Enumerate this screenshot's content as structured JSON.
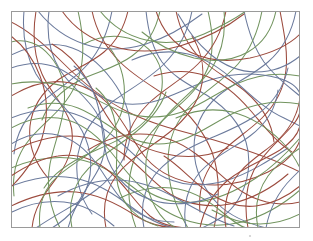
{
  "figure": {
    "width": 313,
    "height": 241,
    "background_color": "#ffffff"
  },
  "frame": {
    "x": 11,
    "y": 11,
    "width": 289,
    "height": 217,
    "stroke_color": "#9a9a9a",
    "stroke_width": 1
  },
  "palette": {
    "red": "#9c4b3e",
    "blue": "#6b7a9c",
    "green": "#72945f",
    "frame": "#9a9a9a",
    "speck": "#cfcfcf"
  },
  "marks": [
    {
      "name": "speck",
      "x": 250,
      "y": 236,
      "r": 1.1,
      "color": "#cfcfcf"
    }
  ],
  "chart_data": {
    "type": "line",
    "xlabel": "",
    "ylabel": "",
    "grid": false,
    "legend": "none",
    "xlim": [
      11,
      300
    ],
    "ylim": [
      11,
      228
    ],
    "stroke_width": 1.05,
    "series": [
      {
        "name": "curve-01",
        "color": "#9c4b3e",
        "d": "M 36 11 C 32 36, 34 56, 42 74 C 50 92, 64 104, 70 122 C 76 140, 70 160, 58 176 C 46 192, 34 206, 32 228"
      },
      {
        "name": "curve-02",
        "color": "#6b7a9c",
        "d": "M 49 11 C 46 34, 50 54, 60 70 C 70 86, 86 96, 96 112 C 106 128, 108 148, 100 166 C 92 184, 76 198, 68 228"
      },
      {
        "name": "curve-03",
        "color": "#9c4b3e",
        "d": "M 11 22 C 28 30, 46 46, 62 62 C 82 82, 104 100, 128 112 C 156 126, 186 132, 214 140 C 244 149, 272 158, 300 172"
      },
      {
        "name": "curve-04",
        "color": "#6b7a9c",
        "d": "M 11 55 C 30 46, 48 42, 66 46 C 86 51, 100 64, 112 80 C 124 96, 132 116, 130 136 C 128 158, 114 176, 96 190 C 78 204, 56 214, 36 228"
      },
      {
        "name": "curve-05",
        "color": "#72945f",
        "d": "M 11 42 C 26 38, 40 44, 50 56 C 62 70, 66 88, 64 106 C 62 126, 54 144, 50 164 C 46 186, 50 208, 60 228"
      },
      {
        "name": "curve-06",
        "color": "#72945f",
        "d": "M 78 11 C 82 28, 84 46, 82 62 C 80 80, 72 94, 62 106 C 50 120, 36 130, 26 144 C 16 158, 12 176, 14 196"
      },
      {
        "name": "curve-07",
        "color": "#9c4b3e",
        "d": "M 92 11 C 96 30, 106 48, 120 62 C 136 78, 156 88, 172 100 C 190 114, 204 132, 212 152 C 220 174, 220 200, 214 228"
      },
      {
        "name": "curve-08",
        "color": "#6b7a9c",
        "d": "M 112 11 C 108 32, 100 50, 88 64 C 74 80, 56 90, 42 102 C 26 116, 16 134, 14 154"
      },
      {
        "name": "curve-09",
        "color": "#72945f",
        "d": "M 84 44 C 100 36, 118 34, 134 40 C 150 46, 160 60, 162 76 C 164 94, 156 110, 144 122 C 130 136, 110 144, 92 152 C 72 161, 54 172, 44 188"
      },
      {
        "name": "curve-10",
        "color": "#9c4b3e",
        "d": "M 128 11 C 124 28, 116 42, 104 52 C 90 64, 72 70, 58 80 C 42 92, 32 108, 30 126 C 28 146, 36 164, 48 178"
      },
      {
        "name": "curve-11",
        "color": "#6b7a9c",
        "d": "M 146 11 C 148 30, 152 48, 162 62 C 174 78, 192 86, 208 96 C 226 108, 240 124, 246 142 C 252 162, 248 184, 238 200 C 228 216, 214 222, 202 228"
      },
      {
        "name": "curve-12",
        "color": "#72945f",
        "d": "M 160 11 C 156 30, 146 46, 132 56 C 116 68, 96 72, 80 80 C 62 90, 48 104, 42 120"
      },
      {
        "name": "curve-13",
        "color": "#9c4b3e",
        "d": "M 176 11 C 180 30, 188 46, 200 58 C 214 72, 232 80, 246 92 C 262 106, 272 124, 274 142"
      },
      {
        "name": "curve-14",
        "color": "#6b7a9c",
        "d": "M 192 11 C 188 32, 178 50, 164 64 C 148 80, 128 90, 112 102 C 94 116, 82 134, 78 154 C 74 176, 80 198, 92 214"
      },
      {
        "name": "curve-15",
        "color": "#72945f",
        "d": "M 208 11 C 212 28, 214 46, 210 62 C 204 82, 190 96, 176 108 C 158 124, 142 140, 134 160 C 126 182, 128 206, 136 228"
      },
      {
        "name": "curve-16",
        "color": "#9c4b3e",
        "d": "M 226 11 C 222 32, 212 50, 198 64 C 182 80, 162 90, 148 104 C 132 120, 124 140, 124 160"
      },
      {
        "name": "curve-17",
        "color": "#6b7a9c",
        "d": "M 244 11 C 248 30, 254 48, 264 62 C 276 78, 290 88, 300 96"
      },
      {
        "name": "curve-18",
        "color": "#72945f",
        "d": "M 262 11 C 258 32, 250 50, 238 64 C 224 80, 206 90, 192 104 C 176 120, 168 140, 168 162 C 168 186, 176 208, 188 228"
      },
      {
        "name": "curve-19",
        "color": "#9c4b3e",
        "d": "M 280 11 C 284 32, 288 52, 286 70 C 284 90, 274 106, 262 118 C 248 132, 230 142, 218 156 C 204 172, 198 192, 200 212"
      },
      {
        "name": "curve-20",
        "color": "#6b7a9c",
        "d": "M 296 11 C 292 32, 282 50, 268 62 C 252 76, 232 84, 218 96 C 202 110, 194 128, 194 148 C 194 170, 204 190, 218 204 C 232 218, 250 224, 266 228"
      },
      {
        "name": "curve-21",
        "color": "#9c4b3e",
        "d": "M 11 96 C 28 86, 46 80, 64 82 C 84 84, 100 94, 112 108 C 126 124, 134 144, 146 158 C 160 174, 180 182, 200 184 C 224 187, 248 182, 268 172 C 286 163, 296 152, 300 140"
      },
      {
        "name": "curve-22",
        "color": "#6b7a9c",
        "d": "M 11 118 C 30 110, 50 108, 68 112 C 88 117, 104 128, 118 140 C 134 154, 148 170, 166 178 C 186 187, 208 186, 228 180 C 250 173, 270 160, 288 148"
      },
      {
        "name": "curve-23",
        "color": "#72945f",
        "d": "M 11 84 C 32 80, 52 82, 70 88 C 90 95, 106 106, 124 112 C 144 119, 164 118, 182 112 C 202 105, 218 92, 236 84 C 256 75, 278 72, 300 76"
      },
      {
        "name": "curve-24",
        "color": "#9c4b3e",
        "d": "M 11 152 C 30 142, 50 136, 70 136 C 92 136, 110 144, 126 156 C 142 168, 154 184, 170 194 C 188 205, 210 208, 230 204 C 252 199, 272 188, 288 174"
      },
      {
        "name": "curve-25",
        "color": "#6b7a9c",
        "d": "M 11 186 C 32 178, 54 174, 74 178 C 96 182, 114 194, 130 206 C 146 218, 160 226, 176 228"
      },
      {
        "name": "curve-26",
        "color": "#72945f",
        "d": "M 11 168 C 30 160, 50 156, 70 158 C 92 160, 110 170, 126 182 C 144 195, 160 210, 180 218 C 200 226, 222 227, 242 222 C 264 216, 284 204, 300 190"
      },
      {
        "name": "curve-27",
        "color": "#9c4b3e",
        "d": "M 11 206 C 32 196, 54 190, 76 192 C 98 194, 118 204, 136 216 C 152 226, 166 228, 180 228"
      },
      {
        "name": "curve-28",
        "color": "#6b7a9c",
        "d": "M 11 68 C 28 62, 44 62, 58 68 C 74 75, 86 88, 100 96 C 116 105, 134 106, 152 102 C 172 97, 190 86, 210 80 C 232 73, 256 72, 278 78 C 292 82, 298 88, 300 94"
      },
      {
        "name": "curve-29",
        "color": "#72945f",
        "d": "M 11 128 C 26 120, 42 116, 58 118 C 76 120, 90 130, 102 142 C 116 156, 126 174, 140 186 C 156 199, 176 204, 196 202 C 218 200, 238 190, 256 178 C 274 166, 288 152, 300 138"
      },
      {
        "name": "curve-30",
        "color": "#9c4b3e",
        "d": "M 11 176 C 26 166, 42 158, 58 156 C 78 153, 96 160, 110 172 C 126 186, 136 204, 150 216 C 164 227, 180 228, 194 228"
      },
      {
        "name": "curve-31",
        "color": "#6b7a9c",
        "d": "M 38 11 C 50 26, 66 38, 84 44 C 104 51, 126 50, 146 44 C 168 37, 186 26, 202 14"
      },
      {
        "name": "curve-32",
        "color": "#9c4b3e",
        "d": "M 62 11 C 74 28, 92 40, 112 46 C 134 53, 158 52, 180 46 C 204 39, 226 28, 244 14"
      },
      {
        "name": "curve-33",
        "color": "#72945f",
        "d": "M 100 11 C 112 26, 128 36, 146 40 C 166 45, 186 42, 204 34 C 222 26, 236 18, 246 11"
      },
      {
        "name": "curve-34",
        "color": "#6b7a9c",
        "d": "M 132 60 C 150 52, 170 50, 188 54 C 208 59, 222 70, 236 82 C 252 96, 266 110, 284 118 C 292 122, 296 124, 300 126"
      },
      {
        "name": "curve-35",
        "color": "#9c4b3e",
        "d": "M 154 76 C 172 70, 190 70, 206 76 C 224 83, 238 96, 250 110 C 264 126, 276 142, 292 152"
      },
      {
        "name": "curve-36",
        "color": "#72945f",
        "d": "M 176 118 C 194 110, 214 108, 232 112 C 252 117, 268 128, 282 142 C 292 152, 296 160, 300 168"
      },
      {
        "name": "curve-37",
        "color": "#6b7a9c",
        "d": "M 58 196 C 76 186, 96 180, 116 180 C 138 180, 158 188, 176 198 C 196 209, 214 220, 234 226"
      },
      {
        "name": "curve-38",
        "color": "#9c4b3e",
        "d": "M 88 150 C 104 140, 122 134, 140 134 C 162 134, 180 142, 196 154 C 214 167, 228 184, 246 194 C 264 204, 284 206, 300 202"
      },
      {
        "name": "curve-39",
        "color": "#72945f",
        "d": "M 120 198 C 136 190, 154 186, 172 188 C 192 190, 208 200, 222 212 C 234 222, 242 228, 248 228"
      },
      {
        "name": "curve-40",
        "color": "#6b7a9c",
        "d": "M 144 228 C 140 208, 144 190, 154 176 C 166 160, 184 150, 202 142 C 222 133, 242 126, 258 114 C 274 102, 284 86, 288 68"
      },
      {
        "name": "curve-41",
        "color": "#9c4b3e",
        "d": "M 106 228 C 102 208, 106 190, 116 176 C 128 160, 146 150, 162 138 C 180 125, 194 110, 200 92 C 206 72, 202 52, 192 36"
      },
      {
        "name": "curve-42",
        "color": "#72945f",
        "d": "M 72 228 C 68 208, 72 190, 82 176 C 94 160, 112 150, 128 138 C 146 125, 160 110, 166 92"
      },
      {
        "name": "curve-43",
        "color": "#6b7a9c",
        "d": "M 186 228 C 182 206, 188 186, 200 172 C 214 156, 234 148, 250 136 C 266 124, 276 108, 278 90"
      },
      {
        "name": "curve-44",
        "color": "#9c4b3e",
        "d": "M 226 228 C 222 206, 228 186, 240 172 C 252 158, 268 150, 280 138 C 292 126, 298 112, 300 98"
      },
      {
        "name": "curve-45",
        "color": "#72945f",
        "d": "M 258 228 C 254 208, 258 190, 268 176 C 278 162, 292 154, 300 148"
      },
      {
        "name": "curve-46",
        "color": "#6b7a9c",
        "d": "M 24 11 C 22 34, 26 56, 36 74 C 48 94, 66 106, 78 124 C 90 142, 94 164, 88 184 C 82 204, 68 218, 52 228"
      },
      {
        "name": "curve-47",
        "color": "#9c4b3e",
        "d": "M 11 36 C 24 46, 34 60, 40 76 C 48 96, 48 118, 42 138 C 36 158, 24 174, 12 186"
      },
      {
        "name": "curve-48",
        "color": "#72945f",
        "d": "M 28 108 C 44 102, 62 102, 78 108 C 96 115, 110 128, 126 136 C 144 145, 164 146, 182 140 C 202 133, 218 120, 236 112 C 256 103, 278 100, 300 104"
      },
      {
        "name": "curve-49",
        "color": "#6b7a9c",
        "d": "M 12 212 C 28 204, 46 200, 64 202 C 84 204, 100 214, 114 226"
      },
      {
        "name": "curve-50",
        "color": "#9c4b3e",
        "d": "M 200 228 C 204 208, 214 192, 228 180 C 244 167, 264 160, 280 150 C 292 142, 298 134, 300 126"
      },
      {
        "name": "curve-51",
        "color": "#72945f",
        "d": "M 224 11 C 226 32, 222 52, 212 68 C 200 86, 182 98, 168 114 C 152 132, 144 154, 146 176 C 148 200, 160 220, 176 228"
      },
      {
        "name": "curve-52",
        "color": "#6b7a9c",
        "d": "M 266 228 C 270 206, 280 190, 292 178 C 296 174, 298 172, 300 170"
      },
      {
        "name": "curve-53",
        "color": "#9c4b3e",
        "d": "M 248 228 C 244 206, 246 186, 254 170 C 264 152, 280 140, 292 126 C 298 119, 300 114, 300 110"
      },
      {
        "name": "curve-54",
        "color": "#72945f",
        "d": "M 40 228 C 38 210, 42 194, 52 182 C 64 168, 82 160, 96 148 C 112 135, 122 118, 124 100 C 126 80, 120 62, 110 48"
      },
      {
        "name": "curve-55",
        "color": "#6b7a9c",
        "d": "M 11 144 C 24 136, 38 132, 52 134 C 68 136, 82 146, 92 158 C 104 172, 112 190, 124 202 C 138 216, 156 222, 174 222"
      },
      {
        "name": "curve-56",
        "color": "#9c4b3e",
        "d": "M 156 11 C 162 30, 174 44, 190 52 C 208 61, 230 62, 250 58 C 272 53, 290 44, 300 34"
      },
      {
        "name": "curve-57",
        "color": "#72945f",
        "d": "M 276 11 C 272 30, 262 44, 248 52 C 232 61, 212 62, 194 58 C 174 53, 156 44, 142 32"
      },
      {
        "name": "curve-58",
        "color": "#6b7a9c",
        "d": "M 300 56 C 288 66, 272 72, 256 72 C 238 72, 222 64, 210 54 C 196 42, 186 28, 178 14"
      },
      {
        "name": "curve-59",
        "color": "#9c4b3e",
        "d": "M 300 186 C 288 196, 272 204, 256 206 C 238 208, 222 202, 208 192 C 192 181, 180 166, 164 156"
      },
      {
        "name": "curve-60",
        "color": "#72945f",
        "d": "M 300 214 C 288 220, 274 224, 260 224 C 242 224, 226 218, 212 210"
      },
      {
        "name": "curve-61",
        "color": "#6b7a9c",
        "d": "M 11 232 C 11 232, 11 232, 11 232"
      },
      {
        "name": "curve-62",
        "color": "#9c4b3e",
        "d": "M 52 44 C 66 52, 78 64, 86 78 C 96 94, 102 112, 114 126 C 128 142, 148 150, 166 154 C 188 159, 210 156, 228 148"
      },
      {
        "name": "curve-63",
        "color": "#6b7a9c",
        "d": "M 74 66 C 86 76, 94 90, 98 106 C 103 124, 102 144, 108 160 C 116 180, 132 194, 152 200 C 174 207, 198 204, 218 194"
      },
      {
        "name": "curve-64",
        "color": "#72945f",
        "d": "M 96 88 C 108 98, 114 112, 116 128 C 119 148, 114 168, 118 186 C 123 206, 138 220, 158 226"
      }
    ]
  }
}
